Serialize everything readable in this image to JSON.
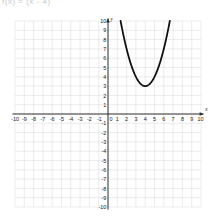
{
  "header": {
    "cutoff_text": "f(x) = (x - 4)"
  },
  "graph": {
    "title": "",
    "axis_labels": {
      "x": "x",
      "y": "y"
    },
    "x_ticks_negative": [
      "-10",
      "-9",
      "-8",
      "-7",
      "-6",
      "-5",
      "-4",
      "-3",
      "-2",
      "-1"
    ],
    "x_ticks_positive": [
      "1",
      "2",
      "3",
      "4",
      "5",
      "6",
      "7",
      "8",
      "9",
      "10"
    ],
    "y_ticks_positive": [
      "1",
      "2",
      "3",
      "4",
      "5",
      "6",
      "7",
      "8",
      "9",
      "10"
    ],
    "y_ticks_negative": [
      "-1",
      "-2",
      "-3",
      "-4",
      "-5",
      "-6",
      "-7",
      "-8",
      "-9",
      "-10"
    ],
    "origin_label": "0",
    "colors": {
      "grid": "#d7d7d7",
      "axis": "#2a2a2a",
      "curve": "#111111",
      "background": "#ffffff"
    }
  },
  "chart_data": {
    "type": "line",
    "title": "",
    "xlabel": "x",
    "ylabel": "y",
    "xlim": [
      -10,
      10
    ],
    "ylim": [
      -10,
      10
    ],
    "grid": true,
    "legend": "none",
    "series": [
      {
        "name": "parabola",
        "equation": "y = (x - 4)^2 + 3",
        "vertex": [
          4,
          3
        ],
        "opens": "up",
        "leading_coefficient": 1,
        "x": [
          1.35,
          1.6,
          1.9,
          2.2,
          2.5,
          2.8,
          3.1,
          3.4,
          3.7,
          4,
          4.3,
          4.6,
          4.9,
          5.2,
          5.5,
          5.8,
          6.1,
          6.4,
          6.65
        ],
        "y": [
          10.02,
          8.76,
          7.41,
          6.24,
          5.25,
          6.44,
          3.81,
          3.36,
          3.09,
          3,
          3.09,
          3.36,
          3.81,
          4.44,
          5.25,
          6.24,
          7.41,
          8.76,
          10.02
        ]
      }
    ],
    "axis_ticks_x": [
      -10,
      -9,
      -8,
      -7,
      -6,
      -5,
      -4,
      -3,
      -2,
      -1,
      0,
      1,
      2,
      3,
      4,
      5,
      6,
      7,
      8,
      9,
      10
    ],
    "axis_ticks_y": [
      -10,
      -9,
      -8,
      -7,
      -6,
      -5,
      -4,
      -3,
      -2,
      -1,
      0,
      1,
      2,
      3,
      4,
      5,
      6,
      7,
      8,
      9,
      10
    ]
  }
}
